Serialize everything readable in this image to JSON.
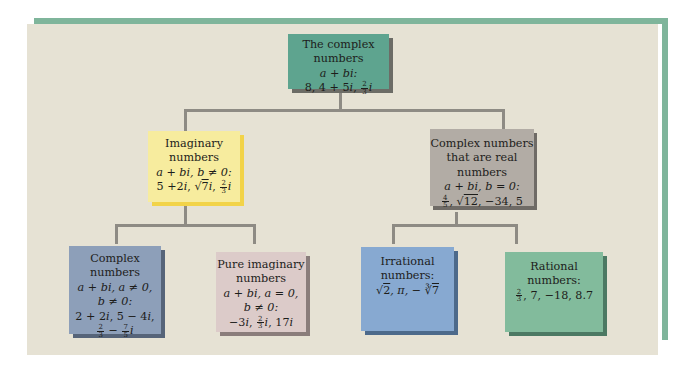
{
  "diagram": {
    "colors": {
      "frame_accent": "#7fb59b",
      "panel_background": "#e6e2d4",
      "connector": "#8e8b84",
      "root_box": "#5ea48f",
      "imaginary_box": "#f7ec9e",
      "real_box": "#b2aca5",
      "complex_box": "#8d9fb9",
      "pure_imaginary_box": "#dccbc9",
      "irrational_box": "#87a9d1",
      "rational_box": "#82bb9c"
    },
    "root": {
      "title": "The complex numbers",
      "form": "a + bi:",
      "examples": "8, 4 + 5i, 2/3 i",
      "ex_a": "8, 4 + 5",
      "ex_b": "i",
      "ex_c": ", ",
      "frac_n": "2",
      "frac_d": "3",
      "ex_d": "i"
    },
    "imaginary": {
      "title_1": "Imaginary",
      "title_2": "numbers",
      "condition": "a + bi, b ≠ 0:",
      "examples": "5 + 2i, √7 i, 2/3 i",
      "ex_a": "5 +2",
      "ex_b": "i",
      "ex_c": ", √",
      "sqrt_arg": "7",
      "ex_d": "i",
      "ex_e": ", ",
      "frac_n": "2",
      "frac_d": "3",
      "ex_f": "i"
    },
    "real": {
      "title_1": "Complex numbers",
      "title_2": "that are real numbers",
      "condition": "a + bi, b = 0:",
      "examples": "4/5, √12, −34, 5",
      "frac_n": "4",
      "frac_d": "5",
      "ex_a": ", √",
      "sqrt_arg": "12",
      "ex_b": ", −34, 5"
    },
    "complex": {
      "title": "Complex numbers",
      "condition_1": "a + bi, a ≠ 0,",
      "condition_2": "b ≠ 0:",
      "examples": "2 + 2i, 5 − 4i, 2/3 − 7/5 i",
      "ex_a": "2 + 2",
      "ex_b": "i",
      "ex_c": ", 5 − 4",
      "ex_d": "i",
      "ex_e": ",",
      "frac1_n": "2",
      "frac1_d": "3",
      "minus": " − ",
      "frac2_n": "7",
      "frac2_d": "5",
      "ex_f": "i"
    },
    "pure_imaginary": {
      "title_1": "Pure imaginary",
      "title_2": "numbers",
      "condition_1": "a + bi, a = 0,",
      "condition_2": "b ≠ 0:",
      "examples": "−3i, 2/3 i, 17i",
      "ex_a": "−3",
      "ex_b": "i",
      "ex_c": ", ",
      "frac_n": "2",
      "frac_d": "3",
      "ex_d": "i",
      "ex_e": ", 17",
      "ex_f": "i"
    },
    "irrational": {
      "title_1": "Irrational",
      "title_2": "numbers:",
      "examples": "√2, π, −∛7",
      "ex_a": "√",
      "sqrt_arg": "2",
      "ex_b": ", π, − ∛",
      "cbrt_arg": "7"
    },
    "rational": {
      "title_1": "Rational",
      "title_2": "numbers:",
      "examples": "2/3, 7, −18, 8.7",
      "frac_n": "2",
      "frac_d": "3",
      "ex_a": ", 7, −18, 8.7"
    }
  }
}
